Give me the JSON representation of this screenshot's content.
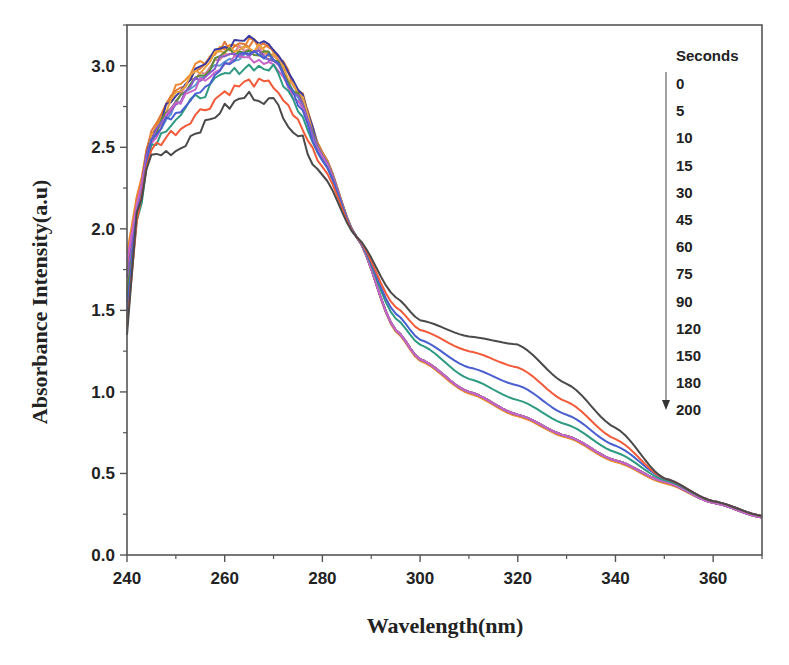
{
  "chart_data": {
    "type": "line",
    "title": "",
    "xlabel": "Wavelength(nm)",
    "ylabel": "Absorbance Intensity(a.u)",
    "xlim": [
      240,
      370
    ],
    "ylim": [
      0.0,
      3.25
    ],
    "x_ticks": [
      240,
      260,
      280,
      300,
      320,
      340,
      360
    ],
    "y_ticks": [
      0.0,
      0.5,
      1.0,
      1.5,
      2.0,
      2.5,
      3.0
    ],
    "x_tick_labels": [
      "240",
      "260",
      "280",
      "300",
      "320",
      "340",
      "360"
    ],
    "y_tick_labels": [
      "0.0",
      "0.5",
      "1.0",
      "1.5",
      "2.0",
      "2.5",
      "3.0"
    ],
    "grid": false,
    "legend": {
      "title": "Seconds",
      "position": "upper right, inside plot",
      "arrow": "down",
      "entries": [
        "0",
        "5",
        "10",
        "15",
        "30",
        "45",
        "60",
        "75",
        "90",
        "120",
        "150",
        "180",
        "200"
      ]
    },
    "x": [
      240,
      242,
      245,
      250,
      255,
      260,
      265,
      270,
      275,
      280,
      287,
      295,
      300,
      310,
      320,
      330,
      340,
      350,
      360,
      370
    ],
    "series": [
      {
        "name": "0",
        "color": "#4a4a4a",
        "values": [
          1.35,
          2.1,
          2.45,
          2.48,
          2.62,
          2.74,
          2.82,
          2.78,
          2.58,
          2.33,
          1.95,
          1.58,
          1.44,
          1.34,
          1.29,
          1.05,
          0.78,
          0.47,
          0.33,
          0.24
        ]
      },
      {
        "name": "5",
        "color": "#f25a3a",
        "values": [
          1.4,
          2.05,
          2.5,
          2.6,
          2.72,
          2.84,
          2.9,
          2.88,
          2.65,
          2.38,
          1.95,
          1.52,
          1.38,
          1.25,
          1.15,
          0.94,
          0.71,
          0.47,
          0.33,
          0.24
        ]
      },
      {
        "name": "10",
        "color": "#4a5fd0",
        "values": [
          1.5,
          2.1,
          2.55,
          2.72,
          2.86,
          3.0,
          3.08,
          3.05,
          2.78,
          2.42,
          1.95,
          1.48,
          1.32,
          1.15,
          1.04,
          0.86,
          0.67,
          0.47,
          0.33,
          0.24
        ]
      },
      {
        "name": "15",
        "color": "#2e9a82",
        "values": [
          1.45,
          2.05,
          2.52,
          2.68,
          2.82,
          2.94,
          3.0,
          2.98,
          2.75,
          2.42,
          1.95,
          1.45,
          1.29,
          1.08,
          0.95,
          0.8,
          0.63,
          0.46,
          0.33,
          0.24
        ]
      },
      {
        "name": "30",
        "color": "#c865c8",
        "values": [
          1.8,
          2.15,
          2.55,
          2.75,
          2.9,
          3.02,
          3.05,
          3.02,
          2.78,
          2.44,
          1.95,
          1.38,
          1.2,
          1.0,
          0.86,
          0.73,
          0.58,
          0.45,
          0.32,
          0.23
        ]
      },
      {
        "name": "45",
        "color": "#8a5cc8",
        "values": [
          1.7,
          2.12,
          2.55,
          2.78,
          2.92,
          3.05,
          3.08,
          3.04,
          2.8,
          2.45,
          1.95,
          1.38,
          1.2,
          1.0,
          0.86,
          0.73,
          0.58,
          0.45,
          0.32,
          0.23
        ]
      },
      {
        "name": "60",
        "color": "#5a8a3a",
        "values": [
          1.6,
          2.1,
          2.55,
          2.8,
          2.95,
          3.08,
          3.1,
          3.06,
          2.82,
          2.45,
          1.95,
          1.38,
          1.2,
          1.0,
          0.86,
          0.73,
          0.58,
          0.45,
          0.32,
          0.23
        ]
      },
      {
        "name": "75",
        "color": "#e8a040",
        "values": [
          1.65,
          2.15,
          2.55,
          2.82,
          2.98,
          3.1,
          3.12,
          3.08,
          2.84,
          2.46,
          1.95,
          1.38,
          1.2,
          1.0,
          0.86,
          0.73,
          0.58,
          0.45,
          0.32,
          0.23
        ]
      },
      {
        "name": "90",
        "color": "#3a3aa0",
        "values": [
          1.55,
          2.12,
          2.58,
          2.84,
          3.0,
          3.12,
          3.16,
          3.1,
          2.85,
          2.46,
          1.95,
          1.38,
          1.2,
          1.0,
          0.86,
          0.73,
          0.58,
          0.45,
          0.32,
          0.23
        ]
      },
      {
        "name": "120",
        "color": "#d4889a",
        "values": [
          1.62,
          2.1,
          2.56,
          2.8,
          2.96,
          3.08,
          3.12,
          3.08,
          2.84,
          2.46,
          1.95,
          1.38,
          1.2,
          1.0,
          0.86,
          0.73,
          0.58,
          0.45,
          0.32,
          0.23
        ]
      },
      {
        "name": "150",
        "color": "#e07838",
        "values": [
          1.75,
          2.18,
          2.58,
          2.84,
          3.0,
          3.12,
          3.14,
          3.1,
          2.86,
          2.47,
          1.95,
          1.38,
          1.2,
          1.0,
          0.86,
          0.73,
          0.58,
          0.45,
          0.32,
          0.23
        ]
      },
      {
        "name": "180",
        "color": "#5a9ad0",
        "values": [
          1.58,
          2.1,
          2.54,
          2.76,
          2.92,
          3.04,
          3.08,
          3.04,
          2.82,
          2.46,
          1.95,
          1.38,
          1.2,
          1.0,
          0.86,
          0.73,
          0.58,
          0.45,
          0.32,
          0.23
        ]
      },
      {
        "name": "200",
        "color": "#f08a30",
        "values": [
          1.85,
          2.2,
          2.6,
          2.86,
          3.02,
          3.12,
          3.14,
          3.1,
          2.86,
          2.47,
          1.95,
          1.37,
          1.19,
          0.99,
          0.85,
          0.72,
          0.57,
          0.44,
          0.32,
          0.23
        ]
      }
    ]
  }
}
